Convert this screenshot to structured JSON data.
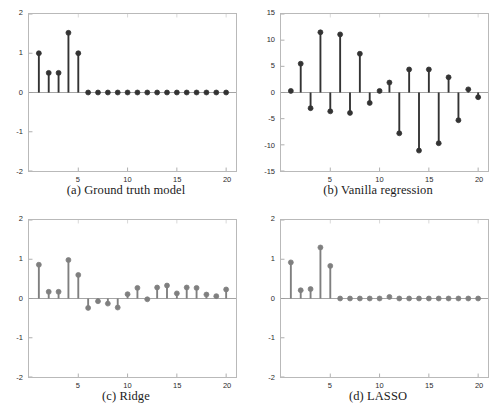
{
  "figure": {
    "background": "#ffffff",
    "width": 504,
    "height": 412
  },
  "chart_data": [
    {
      "id": "panel-a",
      "type": "bar",
      "style": "stem",
      "title": "(a) Ground truth model",
      "caption": "(a) Ground truth model",
      "xlabel": "",
      "ylabel": "",
      "xlim": [
        0,
        21
      ],
      "ylim": [
        -2,
        2
      ],
      "yticks": [
        2,
        1,
        0,
        -1,
        -2
      ],
      "ytick_labels": [
        "2",
        "1",
        "0",
        "-1",
        "-2"
      ],
      "xticks": [
        5,
        10,
        15,
        20
      ],
      "xtick_labels": [
        "5",
        "10",
        "15",
        "20"
      ],
      "grid": false,
      "legend": "none",
      "marker_color": "#333333",
      "stem_color": "#333333",
      "x": [
        1,
        2,
        3,
        4,
        5,
        6,
        7,
        8,
        9,
        10,
        11,
        12,
        13,
        14,
        15,
        16,
        17,
        18,
        19,
        20
      ],
      "values": [
        1.0,
        0.5,
        0.5,
        1.52,
        1.0,
        0,
        0,
        0,
        0,
        0,
        0,
        0,
        0,
        0,
        0,
        0,
        0,
        0,
        0,
        0
      ]
    },
    {
      "id": "panel-b",
      "type": "bar",
      "style": "stem",
      "title": "(b) Vanilla regression",
      "caption": "(b) Vanilla regression",
      "xlabel": "",
      "ylabel": "",
      "xlim": [
        0,
        21
      ],
      "ylim": [
        -15,
        15
      ],
      "yticks": [
        15,
        10,
        5,
        0,
        -5,
        -10,
        -15
      ],
      "ytick_labels": [
        "15",
        "10",
        "5",
        "0",
        "-5",
        "-10",
        "-15"
      ],
      "xticks": [
        5,
        10,
        15,
        20
      ],
      "xtick_labels": [
        "5",
        "10",
        "15",
        "20"
      ],
      "grid": false,
      "legend": "none",
      "marker_color": "#333333",
      "stem_color": "#333333",
      "x": [
        1,
        2,
        3,
        4,
        5,
        6,
        7,
        8,
        9,
        10,
        11,
        12,
        13,
        14,
        15,
        16,
        17,
        18,
        19,
        20
      ],
      "values": [
        0.3,
        5.5,
        -3.0,
        11.5,
        -3.6,
        11.1,
        -3.9,
        7.4,
        -2.0,
        0.3,
        1.9,
        -7.8,
        4.4,
        -11.1,
        4.4,
        -9.7,
        2.9,
        -5.3,
        0.6,
        -0.9
      ]
    },
    {
      "id": "panel-c",
      "type": "bar",
      "style": "stem",
      "title": "(c) Ridge",
      "caption": "(c) Ridge",
      "xlabel": "",
      "ylabel": "",
      "xlim": [
        0,
        21
      ],
      "ylim": [
        -2,
        2
      ],
      "yticks": [
        2,
        1,
        0,
        -1,
        -2
      ],
      "ytick_labels": [
        "2",
        "1",
        "0",
        "-1",
        "-2"
      ],
      "xticks": [
        5,
        10,
        15,
        20
      ],
      "xtick_labels": [
        "5",
        "10",
        "15",
        "20"
      ],
      "grid": false,
      "legend": "none",
      "marker_color": "#7f7f7f",
      "stem_color": "#7f7f7f",
      "x": [
        1,
        2,
        3,
        4,
        5,
        6,
        7,
        8,
        9,
        10,
        11,
        12,
        13,
        14,
        15,
        16,
        17,
        18,
        19,
        20
      ],
      "values": [
        0.86,
        0.17,
        0.17,
        0.98,
        0.6,
        -0.24,
        -0.07,
        -0.13,
        -0.23,
        0.11,
        0.27,
        -0.02,
        0.28,
        0.33,
        0.13,
        0.28,
        0.27,
        0.1,
        0.06,
        0.23
      ]
    },
    {
      "id": "panel-d",
      "type": "bar",
      "style": "stem",
      "title": "(d) LASSO",
      "caption": "(d) LASSO",
      "xlabel": "",
      "ylabel": "",
      "xlim": [
        0,
        21
      ],
      "ylim": [
        -2,
        2
      ],
      "yticks": [
        2,
        1,
        0,
        -1,
        -2
      ],
      "ytick_labels": [
        "2",
        "1",
        "0",
        "-1",
        "-2"
      ],
      "xticks": [
        5,
        10,
        15,
        20
      ],
      "xtick_labels": [
        "5",
        "10",
        "15",
        "20"
      ],
      "grid": false,
      "legend": "none",
      "marker_color": "#7f7f7f",
      "stem_color": "#7f7f7f",
      "x": [
        1,
        2,
        3,
        4,
        5,
        6,
        7,
        8,
        9,
        10,
        11,
        12,
        13,
        14,
        15,
        16,
        17,
        18,
        19,
        20
      ],
      "values": [
        0.92,
        0.21,
        0.24,
        1.3,
        0.83,
        0,
        0,
        0,
        0,
        0,
        0.04,
        0,
        0,
        0,
        0,
        0,
        0,
        0,
        0,
        0
      ]
    }
  ]
}
